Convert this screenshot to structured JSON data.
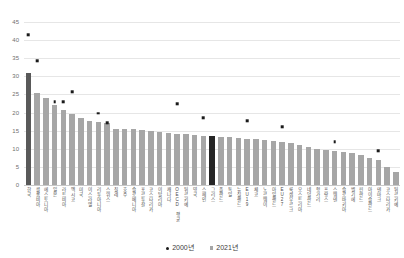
{
  "chart_data": {
    "type": "bar",
    "title": "",
    "xlabel": "",
    "ylabel": "",
    "ylim": [
      0,
      45
    ],
    "ytick_values": [
      45,
      40,
      35,
      30,
      25,
      20,
      15,
      10,
      5,
      0
    ],
    "grid": true,
    "legend_position": "bottom",
    "highlight_index": 21,
    "first_bar_index": 0,
    "categories": [
      "한국",
      "콜롬비아",
      "에스토니아",
      "일본",
      "라트비아",
      "멕시코",
      "미국",
      "이스라엘",
      "리투아니아",
      "스위스",
      "칠레",
      "호주",
      "슬로베니아",
      "포르투갈",
      "코스타리카",
      "이탈리아",
      "캐나다",
      "OECD 평균",
      "튀르키예",
      "영국",
      "스페인",
      "그리스",
      "폴란드",
      "독일",
      "뉴질랜드",
      "EU19",
      "체코",
      "노르웨이",
      "아일랜드",
      "EU27",
      "룩셈부르크",
      "오스트리아",
      "네덜란드",
      "헝가리",
      "프랑스",
      "스웨덴",
      "슬로바키아",
      "벨기에",
      "핀란드",
      "아이슬란드",
      "덴마크",
      "코스타리카",
      "튀르키예"
    ],
    "series": [
      {
        "name": "2021년",
        "marker": "square",
        "color": "#a6a6a6",
        "values": [
          31.0,
          25.3,
          24.1,
          22.0,
          20.8,
          19.5,
          18.5,
          17.6,
          17.3,
          17.0,
          15.6,
          15.5,
          15.4,
          15.2,
          14.8,
          14.6,
          14.4,
          14.2,
          14.0,
          13.7,
          13.5,
          13.4,
          13.3,
          13.2,
          13.0,
          12.8,
          12.6,
          12.4,
          12.2,
          11.9,
          11.6,
          11.0,
          10.4,
          9.9,
          9.6,
          9.4,
          9.1,
          8.8,
          8.2,
          7.4,
          6.8,
          5.0,
          3.6
        ]
      },
      {
        "name": "2000년",
        "marker": "dot",
        "color": "#1a1a1a",
        "values": [
          41.5,
          34.3,
          null,
          23.0,
          22.9,
          25.8,
          null,
          null,
          19.8,
          17.1,
          null,
          null,
          null,
          null,
          null,
          null,
          null,
          22.5,
          null,
          null,
          18.5,
          null,
          null,
          null,
          null,
          17.8,
          null,
          null,
          null,
          16.0,
          null,
          null,
          null,
          null,
          null,
          12.0,
          null,
          null,
          null,
          null,
          9.5,
          null,
          null
        ]
      }
    ],
    "legend": [
      {
        "label": "2000년",
        "marker": "dot",
        "color": "#1a1a1a"
      },
      {
        "label": "2021년",
        "marker": "square",
        "color": "#a6a6a6"
      }
    ]
  },
  "colors": {
    "bar_default": "#a6a6a6",
    "bar_first": "#595959",
    "bar_highlight": "#262626",
    "dot": "#1a1a1a",
    "gridline": "#e6e6e6",
    "axis_text": "#6f6f6f",
    "background": "#ffffff"
  }
}
